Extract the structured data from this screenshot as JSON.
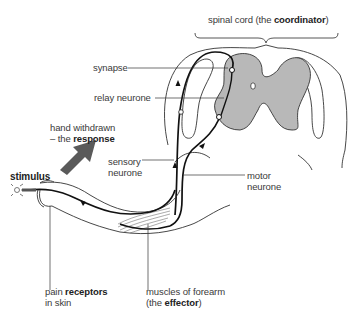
{
  "diagram": {
    "type": "reflex-arc",
    "labels": {
      "spinal_cord": {
        "pre": "spinal cord (the ",
        "bold": "coordinator",
        "post": ")"
      },
      "synapse": "synapse",
      "relay_neurone": "relay neurone",
      "hand_withdrawn_line1": "hand withdrawn",
      "hand_withdrawn_line2_pre": "– the ",
      "hand_withdrawn_line2_bold": "response",
      "stimulus": "stimulus",
      "sensory_line1": "sensory",
      "sensory_line2": "neurone",
      "motor_line1": "motor",
      "motor_line2": "neurone",
      "receptors_line1_pre": "pain ",
      "receptors_line1_bold": "receptors",
      "receptors_line2": "in skin",
      "muscles_line1": "muscles of forearm",
      "muscles_line2_pre": "(the ",
      "muscles_line2_bold": "effector",
      "muscles_line2_post": ")"
    },
    "colors": {
      "grey_matter": "#b8b8b8",
      "arrow": "#5a5a5a",
      "outline": "#333333",
      "nerve": "#111111"
    }
  }
}
